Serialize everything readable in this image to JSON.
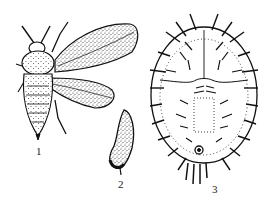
{
  "figure": {
    "panels": [
      {
        "id": "adult",
        "label": "1"
      },
      {
        "id": "egg",
        "label": "2"
      },
      {
        "id": "pupa",
        "label": "3"
      }
    ]
  },
  "colors": {
    "ink": "#111111",
    "stipple": "#333333",
    "background": "#ffffff"
  }
}
